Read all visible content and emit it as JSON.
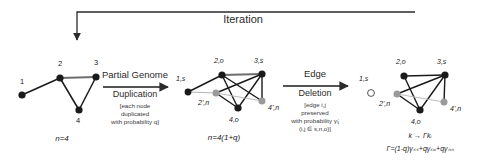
{
  "figure": {
    "type": "network-duplication-divergence-schematic",
    "iteration_label": "Iteration",
    "background": "#ffffff",
    "line_color": "#2b2b2b",
    "node_fill_dark": "#1a1a1a",
    "node_fill_gray": "#9a9a9a",
    "node_fill_empty": "#ffffff"
  },
  "stage1": {
    "name": "initial-graph",
    "count_label": "n=4",
    "nodes": [
      {
        "id": "1",
        "label": "1",
        "x": 22,
        "y": 95,
        "fill": "dark",
        "label_x": 20,
        "label_y": 80
      },
      {
        "id": "2",
        "label": "2",
        "x": 60,
        "y": 78,
        "fill": "dark",
        "label_x": 58,
        "label_y": 62
      },
      {
        "id": "3",
        "label": "3",
        "x": 96,
        "y": 77,
        "fill": "dark",
        "label_x": 94,
        "label_y": 61
      },
      {
        "id": "4",
        "label": "4",
        "x": 79,
        "y": 110,
        "fill": "dark",
        "label_x": 77,
        "label_y": 120
      }
    ],
    "edges": [
      {
        "from": "1",
        "to": "2",
        "style": "dark"
      },
      {
        "from": "2",
        "to": "3",
        "style": "dark"
      },
      {
        "from": "2",
        "to": "4",
        "style": "dark"
      },
      {
        "from": "3",
        "to": "4",
        "style": "dark"
      }
    ]
  },
  "transition1": {
    "name": "duplication-arrow",
    "title": "Partial Genome",
    "subtitle": "Duplication",
    "detail_lines": [
      "[each node",
      "duplicated",
      "with probability q]"
    ]
  },
  "stage2": {
    "name": "duplicated-graph",
    "count_label": "n=4(1+q)",
    "nodes": [
      {
        "id": "1s",
        "label": "1,s",
        "x": 188,
        "y": 92,
        "fill": "dark",
        "label_x": 178,
        "label_y": 78
      },
      {
        "id": "2o",
        "label": "2,o",
        "x": 222,
        "y": 75,
        "fill": "dark",
        "label_x": 217,
        "label_y": 60
      },
      {
        "id": "3s",
        "label": "3,s",
        "x": 262,
        "y": 74,
        "fill": "dark",
        "label_x": 257,
        "label_y": 60
      },
      {
        "id": "2n",
        "label": "2',n",
        "x": 216,
        "y": 93,
        "fill": "gray",
        "label_x": 200,
        "label_y": 102
      },
      {
        "id": "4o",
        "label": "4,o",
        "x": 238,
        "y": 108,
        "fill": "dark",
        "label_x": 232,
        "label_y": 119
      },
      {
        "id": "4n",
        "label": "4',n",
        "x": 262,
        "y": 101,
        "fill": "gray",
        "label_x": 267,
        "label_y": 107
      }
    ],
    "edges": [
      {
        "from": "1s",
        "to": "2o",
        "style": "dark"
      },
      {
        "from": "2o",
        "to": "3s",
        "style": "dark"
      },
      {
        "from": "2o",
        "to": "4o",
        "style": "dark"
      },
      {
        "from": "2o",
        "to": "4n",
        "style": "dark"
      },
      {
        "from": "3s",
        "to": "4o",
        "style": "dark"
      },
      {
        "from": "3s",
        "to": "4n",
        "style": "dark"
      },
      {
        "from": "3s",
        "to": "2n",
        "style": "dark"
      },
      {
        "from": "2n",
        "to": "4o",
        "style": "dark"
      },
      {
        "from": "2n",
        "to": "4n",
        "style": "gray"
      },
      {
        "from": "1s",
        "to": "2n",
        "style": "gray"
      }
    ]
  },
  "transition2": {
    "name": "edge-deletion-arrow",
    "title": "Edge",
    "subtitle": "Deletion",
    "detail_lines": [
      "[edge i,j",
      "preserved",
      "with probability γᵢⱼ",
      "(i,j ∈ s,n,o)]"
    ]
  },
  "stage3": {
    "name": "pruned-graph",
    "nodes": [
      {
        "id": "1s",
        "label": "1,s",
        "x": 371,
        "y": 93,
        "fill": "empty",
        "label_x": 361,
        "label_y": 78
      },
      {
        "id": "2o",
        "label": "2,o",
        "x": 404,
        "y": 76,
        "fill": "dark",
        "label_x": 399,
        "label_y": 61
      },
      {
        "id": "3s",
        "label": "3,s",
        "x": 445,
        "y": 75,
        "fill": "dark",
        "label_x": 440,
        "label_y": 61
      },
      {
        "id": "2n",
        "label": "2',n",
        "x": 397,
        "y": 94,
        "fill": "gray",
        "label_x": 381,
        "label_y": 103
      },
      {
        "id": "4o",
        "label": "4,o",
        "x": 420,
        "y": 110,
        "fill": "dark",
        "label_x": 414,
        "label_y": 121
      },
      {
        "id": "4n",
        "label": "4',n",
        "x": 444,
        "y": 102,
        "fill": "gray",
        "label_x": 449,
        "label_y": 108
      }
    ],
    "edges": [
      {
        "from": "2o",
        "to": "3s",
        "style": "dark"
      },
      {
        "from": "2o",
        "to": "4o",
        "style": "dark"
      },
      {
        "from": "3s",
        "to": "4o",
        "style": "dark"
      },
      {
        "from": "3s",
        "to": "4n",
        "style": "dark"
      },
      {
        "from": "3s",
        "to": "2n",
        "style": "dark"
      },
      {
        "from": "2n",
        "to": "4o",
        "style": "dark"
      },
      {
        "from": "2n",
        "to": "4n",
        "style": "gray"
      }
    ],
    "formula_line1": "k → Γkᵢ",
    "formula_line2": "Γ=(1-q)γₛₛ+qγₛₒ+qγₙₙ"
  }
}
